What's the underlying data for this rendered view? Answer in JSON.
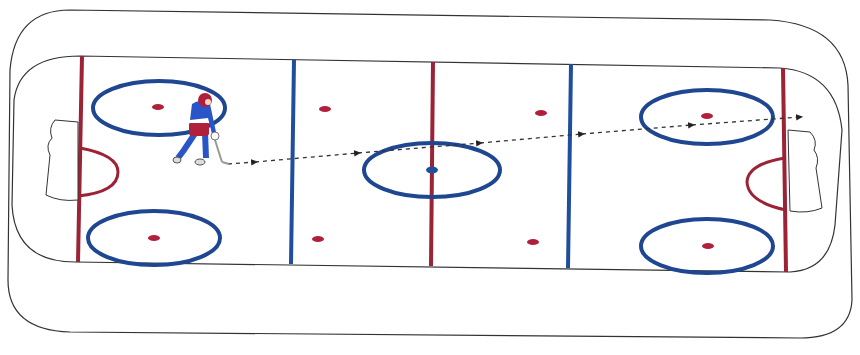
{
  "diagram": {
    "type": "hockey-rink-drill",
    "colors": {
      "board": "#222222",
      "red_line": "#9b2335",
      "blue_line": "#1f4f9c",
      "faceoff_circle": "#1f4690",
      "faceoff_dot": "#b0203a",
      "center_dot": "#1f4f9c",
      "player_jersey": "#2a55c8",
      "player_pants": "#b0203a",
      "puck_path": "#333333"
    },
    "elements": {
      "player": "skater-with-puck",
      "path": "dashed-pass-line-left-to-right",
      "nets": [
        "left-net",
        "right-net"
      ],
      "faceoff_circles": 5,
      "neutral_dots": 4
    }
  }
}
